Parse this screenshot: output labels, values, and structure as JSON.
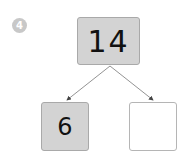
{
  "problem": {
    "number": "4",
    "whole": "14",
    "part_left": "6",
    "part_right": ""
  },
  "colors": {
    "shaded_fill": "#d3d3d3",
    "border": "#a9a9a9",
    "badge": "#c8c8c8",
    "arrow": "#666666"
  }
}
